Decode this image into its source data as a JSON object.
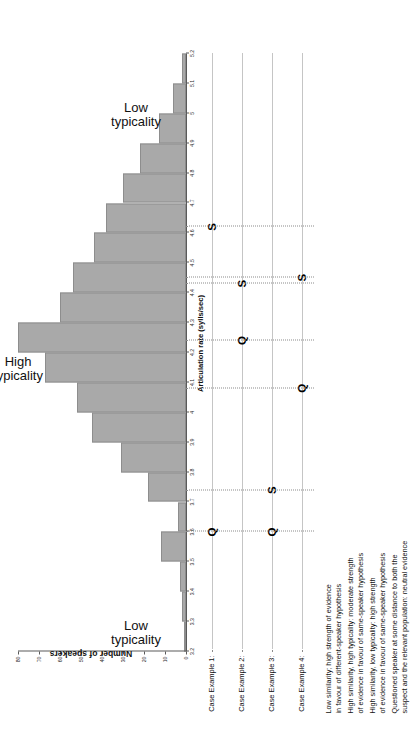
{
  "chart_data": {
    "type": "bar",
    "title": "",
    "xlabel": "Articulation rate (sylls/sec)",
    "ylabel": "Number of speakers",
    "xlim": [
      3.2,
      5.2
    ],
    "ylim": [
      0,
      80
    ],
    "grid": true,
    "legend_position": "none",
    "xticks": [
      "3.2",
      "3.3",
      "3.4",
      "3.5",
      "3.6",
      "3.7",
      "3.8",
      "3.9",
      "4",
      "4.1",
      "4.2",
      "4.3",
      "4.4",
      "4.5",
      "4.6",
      "4.7",
      "4.8",
      "4.9",
      "5",
      "5.1",
      "5.2"
    ],
    "yticks": [
      "0",
      "10",
      "20",
      "30",
      "40",
      "50",
      "60",
      "70",
      "80"
    ],
    "categories": [
      "3.2",
      "3.3",
      "3.4",
      "3.5",
      "3.6",
      "3.7",
      "3.8",
      "3.9",
      "4.0",
      "4.1",
      "4.2",
      "4.3",
      "4.4",
      "4.5",
      "4.6",
      "4.7",
      "4.8",
      "4.9",
      "5.0",
      "5.1"
    ],
    "values": [
      1,
      2,
      3,
      12,
      4,
      18,
      31,
      45,
      52,
      67,
      80,
      60,
      54,
      44,
      38,
      30,
      22,
      13,
      6,
      2
    ],
    "annotations": [
      {
        "text": "High typicality",
        "position": "center"
      },
      {
        "text": "Low typicality",
        "position": "left-tail"
      },
      {
        "text": "Low typicality",
        "position": "right-tail"
      }
    ],
    "case_examples": [
      {
        "name": "Case Example 1:",
        "markers": [
          {
            "label": "Q",
            "value": 3.6
          },
          {
            "label": "S",
            "value": 4.62
          }
        ],
        "description": "Low similarity; high strength of evidence\nin favour of different-speaker hypothesis"
      },
      {
        "name": "Case Example 2:",
        "markers": [
          {
            "label": "Q",
            "value": 4.24
          },
          {
            "label": "S",
            "value": 4.43
          }
        ],
        "description": "High similarity, high typicality: moderate strength\nof evidence in favour of same-speaker hypothesis"
      },
      {
        "name": "Case Example 3:",
        "markers": [
          {
            "label": "Q",
            "value": 3.6
          },
          {
            "label": "S",
            "value": 3.74
          }
        ],
        "description": "High similarity, low typicality: high strength\nof evidence in favour of same-speaker hypothesis"
      },
      {
        "name": "Case Example 4:",
        "markers": [
          {
            "label": "Q",
            "value": 4.08
          },
          {
            "label": "S",
            "value": 4.45
          }
        ],
        "description": "Questioned speaker at some distance to both the\nsuspect and the relevant population: neutral evidence"
      }
    ]
  },
  "axes": {
    "x_title": "Articulation rate (sylls/sec)",
    "y_title": "Number of speakers"
  },
  "typicality": {
    "high": "High\ntypicality",
    "low_left": "Low\ntypicality",
    "low_right": "Low\ntypicality"
  },
  "cases": {
    "c1": {
      "name": "Case Example 1:",
      "q": "Q",
      "s": "S",
      "desc": "Low similarity; high strength of evidence\nin favour of different-speaker hypothesis"
    },
    "c2": {
      "name": "Case Example 2:",
      "q": "Q",
      "s": "S",
      "desc": "High similarity, high typicality: moderate strength\nof evidence in favour of same-speaker hypothesis"
    },
    "c3": {
      "name": "Case Example 3:",
      "q": "Q",
      "s": "S",
      "desc": "High similarity, low typicality: high strength\nof evidence in favour of same-speaker hypothesis"
    },
    "c4": {
      "name": "Case Example 4:",
      "q": "Q",
      "s": "S",
      "desc": "Questioned speaker at some distance to both the\nsuspect and the relevant population: neutral evidence"
    }
  },
  "colors": {
    "bar_fill": "#a9a9a9",
    "bar_stroke": "#8d8d8d",
    "axis": "#5a5a5a",
    "grid": "#8c8c8c",
    "text": "#111111"
  }
}
